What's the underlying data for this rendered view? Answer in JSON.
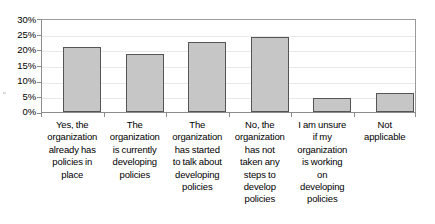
{
  "chart_data": {
    "type": "bar",
    "title": "",
    "subtitle": "",
    "xlabel": "",
    "ylabel": "",
    "ylim": [
      0,
      30
    ],
    "y_tick_labels": [
      "0%",
      "5%",
      "10%",
      "15%",
      "20%",
      "25%",
      "30%"
    ],
    "y_tick_values": [
      0,
      5,
      10,
      15,
      20,
      25,
      30
    ],
    "grid": true,
    "legend": false,
    "legend_position": "none",
    "bar_fill_color": "#c6c6c6",
    "bar_border_color": "#555555",
    "categories": [
      "Yes, the organization already has policies in place",
      "The organization is currently developing policies",
      "The organization has started to talk about developing policies",
      "No, the organization has not taken any steps to develop policies",
      "I am unsure if my organization is working on developing policies",
      "Not applicable"
    ],
    "category_lines": [
      [
        "Yes, the",
        "organization",
        "already has",
        "policies in",
        "place"
      ],
      [
        "The",
        "organization",
        "is currently",
        "developing",
        "policies"
      ],
      [
        "The",
        "organization",
        "has started",
        "to talk about",
        "developing",
        "policies"
      ],
      [
        "No, the",
        "organization",
        "has not",
        "taken any",
        "steps to",
        "develop",
        "policies"
      ],
      [
        "I am unsure",
        "if my",
        "organization",
        "is working",
        "on",
        "developing",
        "policies"
      ],
      [
        "Not",
        "applicable"
      ]
    ],
    "values": [
      20.8,
      18.6,
      22.2,
      23.8,
      4.5,
      6.2
    ],
    "value_labels": [
      "20.8%",
      "18.6%",
      "22.2%",
      "23.8%",
      "4.5%",
      "6.2%"
    ]
  }
}
